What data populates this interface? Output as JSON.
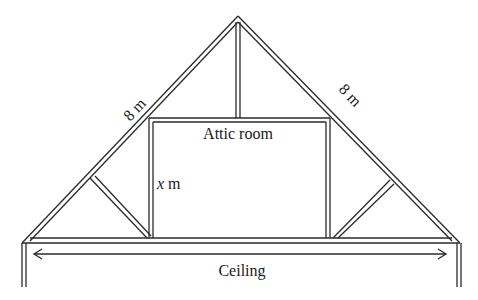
{
  "diagram": {
    "type": "roof-truss",
    "labels": {
      "left_rafter": "8 m",
      "right_rafter": "8 m",
      "room": "Attic room",
      "room_height_var": "x",
      "room_height_unit": " m",
      "ceiling": "Ceiling"
    },
    "colors": {
      "stroke": "#2a2a2a",
      "background": "#ffffff"
    }
  }
}
